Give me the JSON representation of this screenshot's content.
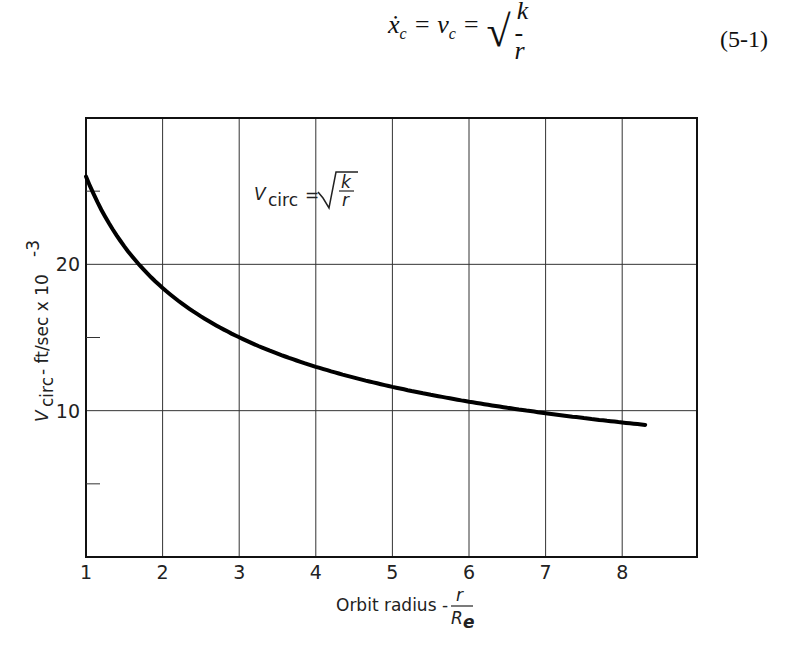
{
  "equation": {
    "lhs": "ẋ",
    "lhs_sub": "c",
    "mid": "= v",
    "mid_sub": "c",
    "eq": "=",
    "num": "k",
    "den": "r",
    "number": "(5-1)"
  },
  "annotation": {
    "v": "V",
    "sub": "circ",
    "eq": "=",
    "num": "k",
    "den": "r"
  },
  "chart_data": {
    "type": "line",
    "title": "",
    "xlabel": "Orbit radius - r/R_e",
    "xlabel_text": "Orbit radius -",
    "xlabel_num": "r",
    "xlabel_den": "R",
    "xlabel_den_sub": "e",
    "ylabel": "V_circ - ft/sec x 10^-3",
    "ylabel_v": "V",
    "ylabel_sub": "circ",
    "ylabel_rest": " - ft/sec x 10",
    "ylabel_exp": "-3",
    "xlim": [
      1,
      9
    ],
    "ylim": [
      0,
      30
    ],
    "x_ticks": [
      "1",
      "2",
      "3",
      "4",
      "5",
      "6",
      "7",
      "8"
    ],
    "y_ticks": [
      "10",
      "20"
    ],
    "y_minor_ticks": [
      5,
      15,
      25
    ],
    "grid": true,
    "annotation": "V_circ = sqrt(k/r)",
    "series": [
      {
        "name": "V_circ",
        "x": [
          1.0,
          1.25,
          1.5,
          1.75,
          2.0,
          2.5,
          3.0,
          3.5,
          4.0,
          4.5,
          5.0,
          5.5,
          6.0,
          6.5,
          7.0,
          7.5,
          8.0,
          8.3
        ],
        "values": [
          26.0,
          23.3,
          21.2,
          19.7,
          18.4,
          16.4,
          15.0,
          13.9,
          13.0,
          12.3,
          11.6,
          11.1,
          10.6,
          10.2,
          9.8,
          9.5,
          9.2,
          9.0
        ]
      }
    ]
  }
}
